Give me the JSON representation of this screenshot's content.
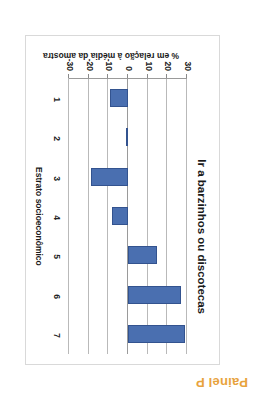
{
  "panel": {
    "label": "Painel P",
    "color": "#E8A33D"
  },
  "chart_data": {
    "type": "bar",
    "title": "Ir a barzinhos ou discotecas",
    "orientation": "vertical",
    "rotated_180": true,
    "categories": [
      "1",
      "2",
      "3",
      "4",
      "5",
      "6",
      "7"
    ],
    "values": [
      29,
      27,
      15,
      -8,
      -19,
      -1,
      -9
    ],
    "xlabel": "Estrato socioeconômico",
    "ylabel": "% em relação à média da amostra",
    "ylim": [
      -30,
      30
    ],
    "yticks": [
      30,
      20,
      10,
      0,
      -10,
      -20,
      -30
    ],
    "ytick_labels": [
      "30",
      "20",
      "10",
      "0",
      "-10",
      "-20",
      "-30"
    ],
    "grid": true,
    "legend": false,
    "bar_color": "#4A6FB0"
  }
}
